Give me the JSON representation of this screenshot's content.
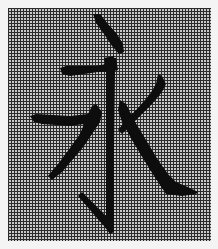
{
  "image": {
    "description": "Chinese character rendered on a dense pixel grid",
    "character": "永",
    "grid": {
      "line_color": "#2b2b2b",
      "cell_color": "#c9c9c9",
      "pitch_px": 3
    },
    "stroke_color": "#0d0d0d",
    "background_color": "#f4f4f4"
  }
}
